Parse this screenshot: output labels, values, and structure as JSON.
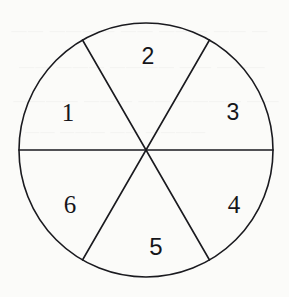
{
  "figure": {
    "name": "fraction-circle-sixths",
    "background_color": "#fbfbf9",
    "stroke_color": "#1a1a1f",
    "stroke_width": 1.6,
    "circle": {
      "center_x": 146,
      "center_y": 150,
      "radius": 127
    },
    "dividers": [
      {
        "label": "horizontal-diameter",
        "angle_degrees": 0
      },
      {
        "label": "oblique-diameter-left",
        "angle_degrees": 60
      },
      {
        "label": "oblique-diameter-right",
        "angle_degrees": 120
      }
    ],
    "sector_count": 6,
    "sectors": [
      {
        "label": "2",
        "position": "top",
        "x": 148,
        "y": 56,
        "class": "num-2"
      },
      {
        "label": "3",
        "position": "upper-right",
        "x": 233,
        "y": 112,
        "class": "num-3"
      },
      {
        "label": "4",
        "position": "lower-right",
        "x": 234,
        "y": 204,
        "class": "num-4"
      },
      {
        "label": "5",
        "position": "bottom",
        "x": 156,
        "y": 247,
        "class": "num-5"
      },
      {
        "label": "6",
        "position": "lower-left",
        "x": 70,
        "y": 204,
        "class": "num-6"
      },
      {
        "label": "1",
        "position": "left",
        "x": 68,
        "y": 112,
        "class": "num-1"
      }
    ]
  },
  "bleed_through": {
    "note": "faint mirrored show-through text from the reverse side of the page",
    "lines": [
      "— —— ——— —— ———— ——",
      "——— —— ———— ——— ——",
      "—— ———— —— ——— ————",
      "———— —— ——— ——"
    ]
  }
}
